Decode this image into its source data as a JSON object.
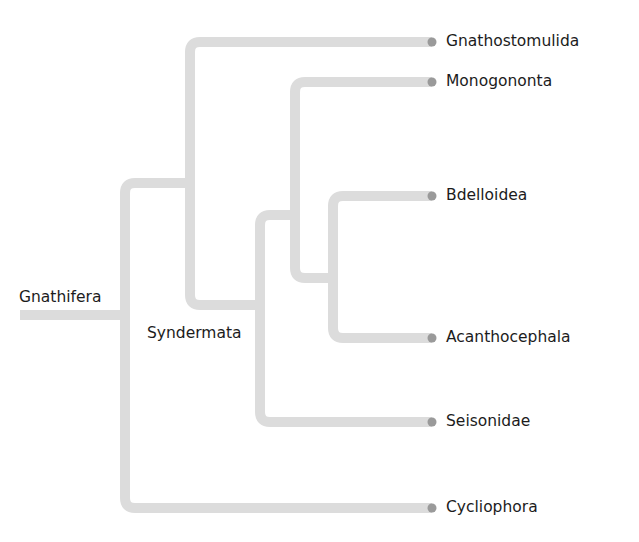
{
  "diagram": {
    "type": "phylogenetic-tree",
    "root": {
      "label": "Gnathifera",
      "children": [
        {
          "label": "Cycliophora"
        },
        {
          "label": "",
          "children": [
            {
              "label": "Gnathostomulida"
            },
            {
              "label": "Syndermata",
              "children": [
                {
                  "label": "",
                  "children": [
                    {
                      "label": "Monogononta"
                    },
                    {
                      "label": "",
                      "children": [
                        {
                          "label": "Bdelloidea"
                        },
                        {
                          "label": "Acanthocephala"
                        }
                      ]
                    }
                  ]
                },
                {
                  "label": "Seisonidae"
                }
              ]
            }
          ]
        }
      ]
    },
    "internal_labels": {
      "root": "Gnathifera",
      "syndermata": "Syndermata"
    },
    "tips": [
      "Gnathostomulida",
      "Monogononta",
      "Bdelloidea",
      "Acanthocephala",
      "Seisonidae",
      "Cycliophora"
    ],
    "colors": {
      "branch": "#dcdcdc",
      "tip_dot": "#9a9a9a",
      "text": "#1c1c1c",
      "background": "#ffffff"
    }
  }
}
